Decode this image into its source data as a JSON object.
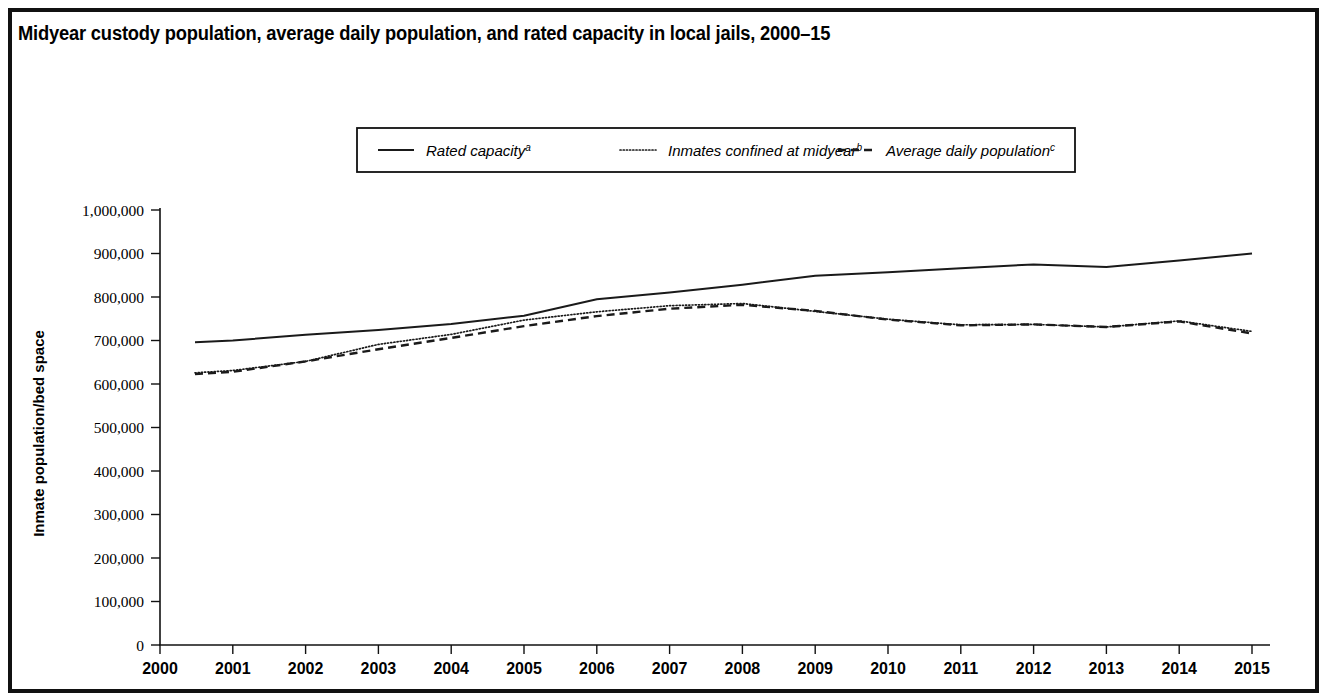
{
  "figure": {
    "title": "Midyear custody population, average daily population, and rated capacity in local jails, 2000–15",
    "border_color": "#111111",
    "background": "#ffffff"
  },
  "legend": {
    "position": "top-center",
    "items": [
      {
        "label": "Rated capacity",
        "sup": "a",
        "style": "solid"
      },
      {
        "label": "Inmates confined at midyear",
        "sup": "b",
        "style": "dotted"
      },
      {
        "label": "Average daily population",
        "sup": "c",
        "style": "dashed"
      }
    ]
  },
  "axes": {
    "ylabel": "Inmate population/bed space",
    "xlabel": "",
    "yticks": [
      "0",
      "100,000",
      "200,000",
      "300,000",
      "400,000",
      "500,000",
      "600,000",
      "700,000",
      "800,000",
      "900,000",
      "1,000,000"
    ],
    "xticks": [
      "2000",
      "2001",
      "2002",
      "2003",
      "2004",
      "2005",
      "2006",
      "2007",
      "2008",
      "2009",
      "2010",
      "2011",
      "2012",
      "2013",
      "2014",
      "2015"
    ]
  },
  "chart_data": {
    "type": "line",
    "title": "Midyear custody population, average daily population, and rated capacity in local jails, 2000–15",
    "xlabel": "",
    "ylabel": "Inmate population/bed space",
    "x": [
      2000,
      2001,
      2002,
      2003,
      2004,
      2005,
      2006,
      2007,
      2008,
      2009,
      2010,
      2011,
      2012,
      2013,
      2014,
      2015
    ],
    "xlim": [
      2000,
      2015
    ],
    "ylim": [
      0,
      1000000
    ],
    "ytick_step": 100000,
    "grid": false,
    "legend_position": "top-center",
    "series": [
      {
        "name": "Rated capacity",
        "footnote": "a",
        "style": "solid",
        "values": [
          692000,
          700000,
          713000,
          724000,
          738000,
          757000,
          795000,
          810000,
          828000,
          849000,
          857000,
          866000,
          875000,
          869000,
          884000,
          900000
        ]
      },
      {
        "name": "Inmates confined at midyear",
        "footnote": "b",
        "style": "dotted",
        "values": [
          621000,
          631000,
          652000,
          691000,
          714000,
          747000,
          766000,
          780000,
          785000,
          767000,
          749000,
          736000,
          737000,
          731000,
          745000,
          721000
        ]
      },
      {
        "name": "Average daily population",
        "footnote": "c",
        "style": "dashed",
        "values": [
          618000,
          628000,
          652000,
          680000,
          706000,
          733000,
          756000,
          773000,
          782000,
          768000,
          748000,
          735000,
          737000,
          731000,
          744000,
          716000
        ]
      }
    ]
  }
}
